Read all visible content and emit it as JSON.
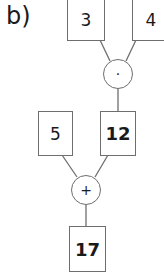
{
  "label": "b)",
  "nodes": {
    "in_a": "3",
    "in_b": "4",
    "op_mul": "·",
    "in_c": "5",
    "res_mul": "12",
    "op_add": "+",
    "res_add": "17"
  }
}
